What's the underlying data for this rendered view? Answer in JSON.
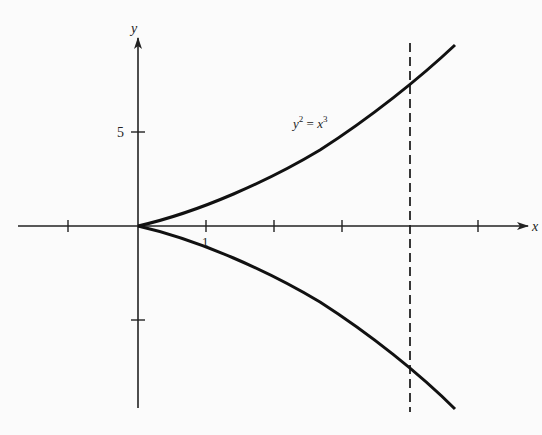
{
  "figure": {
    "equation_label": "y² = x³",
    "equation_base_y": "y",
    "equation_exp_y": "2",
    "equation_eq": " = ",
    "equation_base_x": "x",
    "equation_exp_x": "3",
    "x_axis_label": "x",
    "y_axis_label": "y",
    "y_tick_label_5": "5",
    "x_tick_label_1": "1",
    "vertical_dashed_line_x": 4,
    "x_ticks": [
      -1,
      1,
      2,
      3,
      4,
      5
    ],
    "y_ticks": [
      5,
      -5
    ],
    "curve": "semicubical parabola y^2 = x^3, x from 0 to ~4.6",
    "colors": {
      "curve": "#111111",
      "axes": "#222222",
      "background": "#fbfbfb"
    }
  }
}
